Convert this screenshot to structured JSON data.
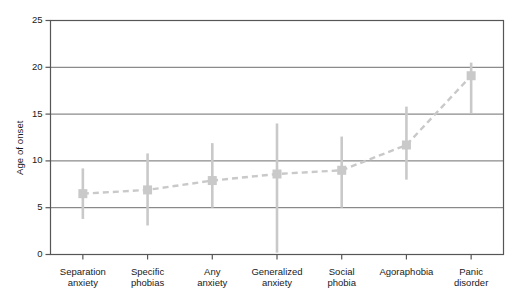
{
  "chart_data": {
    "type": "scatter",
    "title": "",
    "subtitle": "",
    "xlabel": "",
    "ylabel": "Age of onset",
    "ylim": [
      0,
      25
    ],
    "yticks": [
      0,
      5,
      10,
      15,
      20,
      25
    ],
    "ytick_labels": [
      "0",
      "5",
      "10",
      "15",
      "20",
      "25"
    ],
    "grid": true,
    "grid_axis": "y",
    "legend": "none",
    "marker": "square",
    "line_style": "dashed",
    "error_bars": true,
    "series_color": "#c9c9c9",
    "frame_color": "#565656",
    "grid_color": "#6e6e6e",
    "categories": [
      "Separation anxiety",
      "Specific phobias",
      "Any anxiety",
      "Generalized anxiety",
      "Social phobia",
      "Agoraphobia",
      "Panic disorder"
    ],
    "category_lines": [
      [
        "Separation",
        "anxiety"
      ],
      [
        "Specific",
        "phobias"
      ],
      [
        "Any",
        "anxiety"
      ],
      [
        "Generalized",
        "anxiety"
      ],
      [
        "Social",
        "phobia"
      ],
      [
        "Agoraphobia"
      ],
      [
        "Panic",
        "disorder"
      ]
    ],
    "values": [
      6.5,
      6.9,
      7.9,
      8.6,
      9.0,
      11.7,
      19.1
    ],
    "error_low": [
      3.8,
      3.1,
      5.0,
      0.2,
      5.0,
      8.0,
      15.1
    ],
    "error_high": [
      9.2,
      10.8,
      11.9,
      14.0,
      12.6,
      15.8,
      20.5
    ],
    "series": [
      {
        "name": "Age of onset",
        "values": [
          6.5,
          6.9,
          7.9,
          8.6,
          9.0,
          11.7,
          19.1
        ],
        "error_low": [
          3.8,
          3.1,
          5.0,
          0.2,
          5.0,
          8.0,
          15.1
        ],
        "error_high": [
          9.2,
          10.8,
          11.9,
          14.0,
          12.6,
          15.8,
          20.5
        ]
      }
    ]
  }
}
